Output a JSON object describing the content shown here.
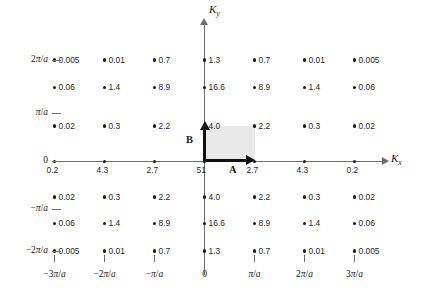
{
  "figure": {
    "type": "reciprocal-lattice-intensity-map",
    "x_axis_label": "K",
    "x_axis_subscript": "x",
    "y_axis_label": "K",
    "y_axis_subscript": "y",
    "vector_a_label": "A",
    "vector_b_label": "B"
  },
  "axes": {
    "x_ticks": [
      "−3π/a",
      "−2π/a",
      "−π/a",
      "0",
      "π/a",
      "2π/a",
      "3π/a"
    ],
    "y_ticks": [
      "2π/a",
      "π/a",
      "0",
      "−π/a",
      "−2π/a"
    ]
  },
  "chart_data": {
    "type": "scatter",
    "title": "",
    "xlabel": "Kx",
    "ylabel": "Ky",
    "grid": false,
    "legend": "none",
    "x": [
      "−3π/a",
      "−2π/a",
      "−π/a",
      "0",
      "π/a",
      "2π/a",
      "3π/a"
    ],
    "y": [
      "2π/a",
      "3π/2a",
      "π/2a",
      "0",
      "−π/2a",
      "−3π/2a",
      "−2π/a"
    ],
    "rows": [
      {
        "row_label": "2π/a",
        "values": [
          "0.005",
          "0.01",
          "0.7",
          "1.3",
          "0.7",
          "0.01",
          "0.005"
        ]
      },
      {
        "row_label": "",
        "values": [
          "0.06",
          "1.4",
          "8.9",
          "16.6",
          "8.9",
          "1.4",
          "0.06"
        ]
      },
      {
        "row_label": "",
        "values": [
          "0.02",
          "0.3",
          "2.2",
          "4.0",
          "2.2",
          "0.3",
          "0.02"
        ]
      },
      {
        "row_label": "0",
        "values": [
          "0.2",
          "4.3",
          "2.7",
          "51",
          "2.7",
          "4.3",
          "0.2"
        ]
      },
      {
        "row_label": "",
        "values": [
          "0.02",
          "0.3",
          "2.2",
          "4.0",
          "2.2",
          "0.3",
          "0.02"
        ]
      },
      {
        "row_label": "",
        "values": [
          "0.06",
          "1.4",
          "8.9",
          "16.6",
          "8.9",
          "1.4",
          "0.06"
        ]
      },
      {
        "row_label": "−2π/a",
        "values": [
          "0.005",
          "0.01",
          "0.7",
          "1.3",
          "0.7",
          "0.01",
          "0.005"
        ]
      }
    ]
  },
  "colors": {
    "axis": "#6e6e6e",
    "dot": "#1c1c1c",
    "vector": "#111111",
    "unit_cell_fill": "#e9e9e9",
    "background": "#ffffff"
  }
}
